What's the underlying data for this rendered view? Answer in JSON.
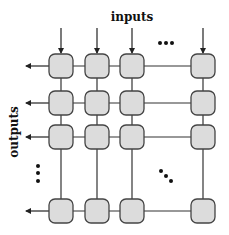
{
  "diagram": {
    "title_top": "inputs",
    "title_left": "outputs",
    "colors": {
      "node_fill": "#dcdcdc",
      "node_stroke": "#444444",
      "line": "#333333",
      "dot": "#111111",
      "background": "#ffffff"
    },
    "grid": {
      "columns": [
        61,
        97,
        132,
        203
      ],
      "rows": [
        66,
        103,
        137,
        211
      ],
      "node_size": 24,
      "node_radius": 6
    },
    "ellipsis": {
      "horizontal": "more input columns",
      "vertical": "more output rows",
      "diagonal": "more nodes"
    }
  }
}
